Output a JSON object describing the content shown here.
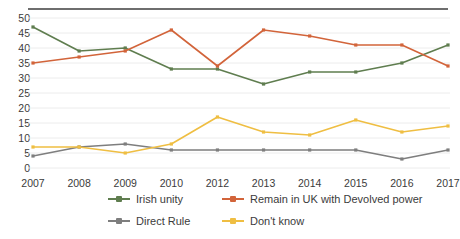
{
  "chart_data": {
    "type": "line",
    "title": "",
    "subtitle": "",
    "xlabel": "",
    "ylabel": "",
    "categories": [
      "2007",
      "2008",
      "2009",
      "2010",
      "2012",
      "2013",
      "2014",
      "2015",
      "2016",
      "2017"
    ],
    "x": [
      2007,
      2008,
      2009,
      2010,
      2012,
      2013,
      2014,
      2015,
      2016,
      2017
    ],
    "ylim": [
      0,
      50
    ],
    "ytick_step": 5,
    "yticks": [
      0,
      5,
      10,
      15,
      20,
      25,
      30,
      35,
      40,
      45,
      50
    ],
    "grid": "horizontal",
    "legend_position": "bottom",
    "series": [
      {
        "name": "Irish unity",
        "color": "#5f7d4f",
        "values": [
          47,
          39,
          40,
          33,
          33,
          28,
          32,
          32,
          35,
          41
        ]
      },
      {
        "name": "Remain in UK with Devolved power",
        "color": "#d2643a",
        "values": [
          35,
          37,
          39,
          46,
          34,
          46,
          44,
          41,
          41,
          34
        ]
      },
      {
        "name": "Direct Rule",
        "color": "#7e7e7e",
        "values": [
          4,
          7,
          8,
          6,
          6,
          6,
          6,
          6,
          3,
          6
        ]
      },
      {
        "name": "Don't know",
        "color": "#efbe42",
        "values": [
          7,
          7,
          5,
          8,
          17,
          12,
          11,
          16,
          12,
          14
        ]
      }
    ],
    "annotations": [],
    "colors": {
      "background": "#ffffff",
      "gridline": "#ececec",
      "axis_text": "#3b3b3b",
      "top_rule": "#6e6e6e"
    }
  },
  "legend": {
    "items": [
      {
        "label": "Irish unity",
        "icon": "line-marker-icon"
      },
      {
        "label": "Remain in UK with Devolved power",
        "icon": "line-marker-icon"
      },
      {
        "label": "Direct Rule",
        "icon": "line-marker-icon"
      },
      {
        "label": "Don't know",
        "icon": "line-marker-icon"
      }
    ]
  }
}
